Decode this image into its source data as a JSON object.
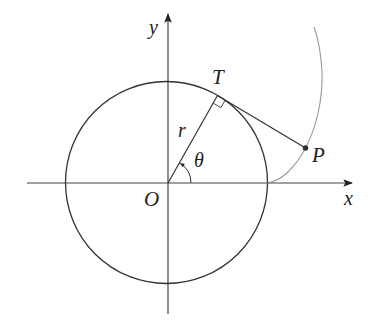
{
  "diagram": {
    "colors": {
      "background": "#ffffff",
      "stroke": "#333333",
      "curve": "#888888",
      "text": "#222222"
    },
    "labels": {
      "y_axis": "y",
      "x_axis": "x",
      "origin": "O",
      "tangent_point": "T",
      "point": "P",
      "radius": "r",
      "angle": "θ"
    },
    "geometry": {
      "origin_px": [
        167,
        183
      ],
      "radius_px": 101,
      "theta_deg": 60,
      "x_axis_px": [
        27,
        354
      ],
      "y_axis_px": [
        314,
        12
      ],
      "T_px": [
        217.5,
        95.5
      ],
      "P_px": [
        305.5,
        148
      ]
    }
  }
}
